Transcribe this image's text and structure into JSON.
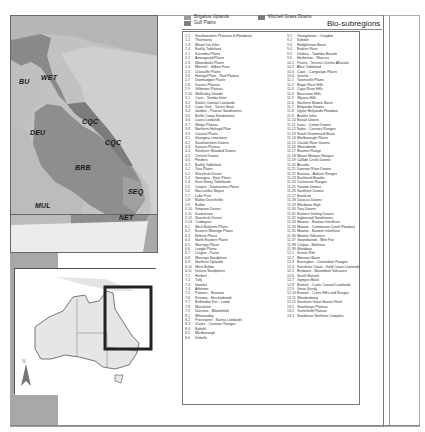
{
  "figure": {
    "title": "Bio-subregions",
    "top_legend": [
      {
        "label": "Brigalow Uplands",
        "color": "#9c9c9c"
      },
      {
        "label": "Gulf Plains",
        "color": "#808080"
      },
      {
        "label": "Mitchell Grass Downs",
        "color": "#7a7a7a"
      }
    ]
  },
  "map": {
    "region_labels": [
      {
        "code": "WET",
        "x": 34,
        "y": 73
      },
      {
        "code": "BU",
        "x": 20,
        "y": 77
      },
      {
        "code": "CQC",
        "x": 73,
        "y": 119
      },
      {
        "code": "DEU",
        "x": 30,
        "y": 130
      },
      {
        "code": "CQC",
        "x": 96,
        "y": 140
      },
      {
        "code": "BRB",
        "x": 71,
        "y": 165
      },
      {
        "code": "SEQ",
        "x": 118,
        "y": 186
      },
      {
        "code": "MUL",
        "x": 33,
        "y": 198
      },
      {
        "code": "NET",
        "x": 108,
        "y": 214
      }
    ],
    "colors": {
      "background_terrain": "#c4c4c4",
      "ocean": "#d3d3d3",
      "region_dark": "#8c8c8c",
      "region_mid": "#a5a5a5",
      "region_light": "#bdbdbd",
      "nsw_white": "#ececec"
    }
  },
  "inset": {
    "north_label": "N",
    "extent_box_color": "#222222"
  },
  "legend": {
    "left_column": [
      {
        "code": "1.1",
        "name": "Southwestern Plateaus & Floodouts"
      },
      {
        "code": "1.2",
        "name": "Thorntonia"
      },
      {
        "code": "1.3",
        "name": "Mount Isa Inlier"
      },
      {
        "code": "1.4",
        "name": "Barkly Tableland"
      },
      {
        "code": "2.1",
        "name": "Karumba Plains"
      },
      {
        "code": "2.2",
        "name": "Armraynald Plains"
      },
      {
        "code": "2.3",
        "name": "Woondoola Plains"
      },
      {
        "code": "2.4",
        "name": "Mitchell - Gilbert Fans"
      },
      {
        "code": "2.5",
        "name": "Claraville Plains"
      },
      {
        "code": "2.6",
        "name": "Holroyd Plain - Red Plateau"
      },
      {
        "code": "2.7",
        "name": "Doomadgee Plains"
      },
      {
        "code": "2.8",
        "name": "Donors Plateau"
      },
      {
        "code": "2.9",
        "name": "Gilberton Plateau"
      },
      {
        "code": "2.10",
        "name": "Wellesley Islands"
      },
      {
        "code": "3.1",
        "name": "Coen - Yambo Inlier"
      },
      {
        "code": "3.2",
        "name": "Starke Coastal Lowlands"
      },
      {
        "code": "3.3",
        "name": "Cape York - Torres Strait"
      },
      {
        "code": "3.4",
        "name": "Jardine - Pascoe Sandstones"
      },
      {
        "code": "3.5",
        "name": "Battle Camp Sandstones"
      },
      {
        "code": "3.6",
        "name": "Laura Lowlands"
      },
      {
        "code": "3.7",
        "name": "Weipa Plateau"
      },
      {
        "code": "3.8",
        "name": "Northern Holroyd Plain"
      },
      {
        "code": "3.9",
        "name": "Coastal Plains"
      },
      {
        "code": "4.1",
        "name": "Georgina Limestone"
      },
      {
        "code": "4.2",
        "name": "Southwestern Downs"
      },
      {
        "code": "4.3",
        "name": "Kynuna Plateau"
      },
      {
        "code": "4.4",
        "name": "Southern Wooded Downs"
      },
      {
        "code": "4.5",
        "name": "Central Downs"
      },
      {
        "code": "4.6",
        "name": "Flinders"
      },
      {
        "code": "4.7",
        "name": "Barkly Tableland"
      },
      {
        "code": "5.1",
        "name": "Tara Plains"
      },
      {
        "code": "5.2",
        "name": "Strzelecki Desert"
      },
      {
        "code": "5.3",
        "name": "Georgina - Eyre Plains"
      },
      {
        "code": "5.4",
        "name": "Sturt Stony Tablelands"
      },
      {
        "code": "5.5",
        "name": "Cooper - Diamantina Plains"
      },
      {
        "code": "5.6",
        "name": "Noccundra Slopes"
      },
      {
        "code": "5.7",
        "name": "Lake Pure"
      },
      {
        "code": "5.8",
        "name": "Bulloo Dunefields"
      },
      {
        "code": "5.9",
        "name": "Bulloo"
      },
      {
        "code": "5.10",
        "name": "Simpson Desert"
      },
      {
        "code": "5.11",
        "name": "Diamantina"
      },
      {
        "code": "5.12",
        "name": "Strzelecki Desert"
      },
      {
        "code": "5.13",
        "name": "Cuddapan"
      },
      {
        "code": "6.1",
        "name": "West Balonne Plains"
      },
      {
        "code": "6.2",
        "name": "Eastern Warrego Plains"
      },
      {
        "code": "6.3",
        "name": "Nebine Plains"
      },
      {
        "code": "6.4",
        "name": "North Eastern Plains"
      },
      {
        "code": "6.5",
        "name": "Warrego Plains"
      },
      {
        "code": "6.6",
        "name": "Langlo Plains"
      },
      {
        "code": "6.7",
        "name": "Culgoa - Paroo"
      },
      {
        "code": "6.8",
        "name": "Warrego Sandplains"
      },
      {
        "code": "6.9",
        "name": "Northern Uplands"
      },
      {
        "code": "6.10",
        "name": "West Bulloo"
      },
      {
        "code": "6.11",
        "name": "Urisino Sandplains"
      },
      {
        "code": "7.1",
        "name": "Herbert"
      },
      {
        "code": "7.2",
        "name": "Tully"
      },
      {
        "code": "7.3",
        "name": "Innisfail"
      },
      {
        "code": "7.4",
        "name": "Atherton"
      },
      {
        "code": "7.5",
        "name": "Paluma - Seaview"
      },
      {
        "code": "7.6",
        "name": "Kirrama - Hinchinbrook"
      },
      {
        "code": "7.7",
        "name": "Bellenden Ker - Lamb"
      },
      {
        "code": "7.8",
        "name": "Macalister"
      },
      {
        "code": "7.9",
        "name": "Daintree - Bloomfield"
      },
      {
        "code": "8.1",
        "name": "Whitsunday"
      },
      {
        "code": "8.2",
        "name": "Proserpine - Sarina Lowlands"
      },
      {
        "code": "8.3",
        "name": "Clarke - Connors Ranges"
      },
      {
        "code": "8.4",
        "name": "Byfield"
      },
      {
        "code": "8.5",
        "name": "Marlborough"
      },
      {
        "code": "8.6",
        "name": "Debella"
      }
    ],
    "right_column": [
      {
        "code": "9.1",
        "name": "Georgetown - Croydon"
      },
      {
        "code": "9.2",
        "name": "Kidston"
      },
      {
        "code": "9.3",
        "name": "Hodgkinson Basin"
      },
      {
        "code": "9.4",
        "name": "Broken River"
      },
      {
        "code": "9.5",
        "name": "Undara - Toomba Basalts"
      },
      {
        "code": "9.6",
        "name": "Herberton - Wairuna"
      },
      {
        "code": "10.1",
        "name": "Prairie - Torrens Creeks Alluvials"
      },
      {
        "code": "10.2",
        "name": "Alice Tableland"
      },
      {
        "code": "10.3",
        "name": "Cape - Campaspe Plains"
      },
      {
        "code": "10.4",
        "name": "Jericho"
      },
      {
        "code": "11.1",
        "name": "Townsville Plains"
      },
      {
        "code": "11.2",
        "name": "Bogie River Hills"
      },
      {
        "code": "11.3",
        "name": "Cape River Hills"
      },
      {
        "code": "11.4",
        "name": "Beucazon Hills"
      },
      {
        "code": "11.5",
        "name": "Wyarra Hills"
      },
      {
        "code": "11.6",
        "name": "Northern Bowen Basin"
      },
      {
        "code": "11.7",
        "name": "Belyando Downs"
      },
      {
        "code": "11.8",
        "name": "Upper Belyando Floodout"
      },
      {
        "code": "11.9",
        "name": "Anakie Inlier"
      },
      {
        "code": "11.10",
        "name": "Basalt Downs"
      },
      {
        "code": "11.11",
        "name": "Isaac - Comet Downs"
      },
      {
        "code": "11.12",
        "name": "Nebo - Connors Ranges"
      },
      {
        "code": "11.13",
        "name": "South Drummond Basin"
      },
      {
        "code": "11.14",
        "name": "Marlborough Plains"
      },
      {
        "code": "11.15",
        "name": "Claude River Downs"
      },
      {
        "code": "11.16",
        "name": "Woorabinda"
      },
      {
        "code": "11.17",
        "name": "Boomer Range"
      },
      {
        "code": "11.18",
        "name": "Mount Morgan Ranges"
      },
      {
        "code": "11.19",
        "name": "Callide Creek Downs"
      },
      {
        "code": "11.20",
        "name": "Arcadia"
      },
      {
        "code": "11.21",
        "name": "Dawson River Downs"
      },
      {
        "code": "11.22",
        "name": "Banana - Auburn Ranges"
      },
      {
        "code": "11.23",
        "name": "Buckland Basalts"
      },
      {
        "code": "11.24",
        "name": "Carnarvon Ranges"
      },
      {
        "code": "11.25",
        "name": "Taroom Downs"
      },
      {
        "code": "11.26",
        "name": "Southern Downs"
      },
      {
        "code": "11.27",
        "name": "Barakula"
      },
      {
        "code": "11.28",
        "name": "Dulacca Downs"
      },
      {
        "code": "11.29",
        "name": "Weribone High"
      },
      {
        "code": "11.30",
        "name": "Tara Downs"
      },
      {
        "code": "11.31",
        "name": "Eastern Darling Downs"
      },
      {
        "code": "11.32",
        "name": "Inglewood Sandstones"
      },
      {
        "code": "11.33",
        "name": "Moonie - Barwon Interfluve"
      },
      {
        "code": "11.34",
        "name": "Moonie - Commoron Creek Floodout"
      },
      {
        "code": "11.35",
        "name": "Moonie - Barwon Interfluve"
      },
      {
        "code": "11.36",
        "name": "Moonie Volcanics"
      },
      {
        "code": "11.37",
        "name": "Goondiwindi - Weir Fan"
      },
      {
        "code": "11.38",
        "name": "Culgoa - Bokhara"
      },
      {
        "code": "11.39",
        "name": "Wandoan"
      },
      {
        "code": "12.1",
        "name": "Scenic Rim"
      },
      {
        "code": "12.2",
        "name": "Moreton Basin"
      },
      {
        "code": "12.3",
        "name": "Burringbar - Conondale Ranges"
      },
      {
        "code": "12.4",
        "name": "Sunshine Coast - Gold Coast Lowlands"
      },
      {
        "code": "12.5",
        "name": "Brisbane - Barambah Volcanics"
      },
      {
        "code": "12.6",
        "name": "South Burnett"
      },
      {
        "code": "12.7",
        "name": "Gympie Block"
      },
      {
        "code": "12.8",
        "name": "Burnett - Curtis Coastal Lowlands"
      },
      {
        "code": "12.9",
        "name": "Great Sandy"
      },
      {
        "code": "12.10",
        "name": "Burnett - Curtis Hills and Ranges"
      },
      {
        "code": "12.11",
        "name": "Woodenbong"
      },
      {
        "code": "12.12",
        "name": "Southern Great Barrier Reef"
      },
      {
        "code": "13.1",
        "name": "Stanthorpe Plateau"
      },
      {
        "code": "13.2",
        "name": "Tenterfield Plateau"
      },
      {
        "code": "13.3",
        "name": "Nandewar Northern Complex"
      }
    ]
  }
}
